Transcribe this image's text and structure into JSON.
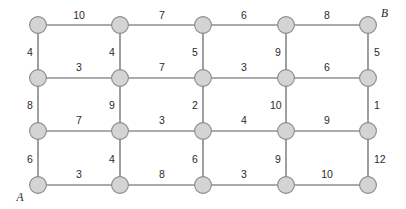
{
  "figure": {
    "background_color": "#ffffff",
    "node_fill_color": "#d4d4d4",
    "node_stroke_color": "#8a8a8a",
    "edge_color": "#58585a",
    "label_color": "#2b2b2b"
  },
  "terminals": [
    {
      "id": "A",
      "label": "A",
      "x": 20,
      "y": 201,
      "col": 0,
      "row": 3
    },
    {
      "id": "B",
      "label": "B",
      "x": 381,
      "y": 17,
      "col": 4,
      "row": 0
    }
  ],
  "geometry": {
    "columns_x": [
      38,
      120,
      203,
      286,
      368
    ],
    "rows_y": [
      25,
      78,
      131,
      185
    ],
    "node_radius": 8.4
  },
  "nodes": [
    {
      "id": "n00",
      "col": 0,
      "row": 0,
      "x": 38,
      "y": 25
    },
    {
      "id": "n10",
      "col": 1,
      "row": 0,
      "x": 120,
      "y": 25
    },
    {
      "id": "n20",
      "col": 2,
      "row": 0,
      "x": 203,
      "y": 25
    },
    {
      "id": "n30",
      "col": 3,
      "row": 0,
      "x": 286,
      "y": 25
    },
    {
      "id": "n40",
      "col": 4,
      "row": 0,
      "x": 368,
      "y": 25
    },
    {
      "id": "n01",
      "col": 0,
      "row": 1,
      "x": 38,
      "y": 78
    },
    {
      "id": "n11",
      "col": 1,
      "row": 1,
      "x": 120,
      "y": 78
    },
    {
      "id": "n21",
      "col": 2,
      "row": 1,
      "x": 203,
      "y": 78
    },
    {
      "id": "n31",
      "col": 3,
      "row": 1,
      "x": 286,
      "y": 78
    },
    {
      "id": "n41",
      "col": 4,
      "row": 1,
      "x": 368,
      "y": 78
    },
    {
      "id": "n02",
      "col": 0,
      "row": 2,
      "x": 38,
      "y": 131
    },
    {
      "id": "n12",
      "col": 1,
      "row": 2,
      "x": 120,
      "y": 131
    },
    {
      "id": "n22",
      "col": 2,
      "row": 2,
      "x": 203,
      "y": 131
    },
    {
      "id": "n32",
      "col": 3,
      "row": 2,
      "x": 286,
      "y": 131
    },
    {
      "id": "n42",
      "col": 4,
      "row": 2,
      "x": 368,
      "y": 131
    },
    {
      "id": "n03",
      "col": 0,
      "row": 3,
      "x": 38,
      "y": 185
    },
    {
      "id": "n13",
      "col": 1,
      "row": 3,
      "x": 120,
      "y": 185
    },
    {
      "id": "n23",
      "col": 2,
      "row": 3,
      "x": 203,
      "y": 185
    },
    {
      "id": "n33",
      "col": 3,
      "row": 3,
      "x": 286,
      "y": 185
    },
    {
      "id": "n43",
      "col": 4,
      "row": 3,
      "x": 368,
      "y": 185
    }
  ],
  "horizontal_edges": [
    {
      "from": "n00",
      "to": "n10",
      "row": 0,
      "weight": 10,
      "label": "10",
      "lx": 79,
      "ly": 19
    },
    {
      "from": "n10",
      "to": "n20",
      "row": 0,
      "weight": 7,
      "label": "7",
      "lx": 162,
      "ly": 19
    },
    {
      "from": "n20",
      "to": "n30",
      "row": 0,
      "weight": 6,
      "label": "6",
      "lx": 244,
      "ly": 19
    },
    {
      "from": "n30",
      "to": "n40",
      "row": 0,
      "weight": 8,
      "label": "8",
      "lx": 327,
      "ly": 19
    },
    {
      "from": "n01",
      "to": "n11",
      "row": 1,
      "weight": 3,
      "label": "3",
      "lx": 79,
      "ly": 71
    },
    {
      "from": "n11",
      "to": "n21",
      "row": 1,
      "weight": 7,
      "label": "7",
      "lx": 162,
      "ly": 71
    },
    {
      "from": "n21",
      "to": "n31",
      "row": 1,
      "weight": 3,
      "label": "3",
      "lx": 244,
      "ly": 71
    },
    {
      "from": "n31",
      "to": "n41",
      "row": 1,
      "weight": 6,
      "label": "6",
      "lx": 327,
      "ly": 71
    },
    {
      "from": "n02",
      "to": "n12",
      "row": 2,
      "weight": 7,
      "label": "7",
      "lx": 79,
      "ly": 124
    },
    {
      "from": "n12",
      "to": "n22",
      "row": 2,
      "weight": 3,
      "label": "3",
      "lx": 162,
      "ly": 124
    },
    {
      "from": "n22",
      "to": "n32",
      "row": 2,
      "weight": 4,
      "label": "4",
      "lx": 244,
      "ly": 124
    },
    {
      "from": "n32",
      "to": "n42",
      "row": 2,
      "weight": 9,
      "label": "9",
      "lx": 327,
      "ly": 124
    },
    {
      "from": "n03",
      "to": "n13",
      "row": 3,
      "weight": 3,
      "label": "3",
      "lx": 79,
      "ly": 178
    },
    {
      "from": "n13",
      "to": "n23",
      "row": 3,
      "weight": 8,
      "label": "8",
      "lx": 162,
      "ly": 178
    },
    {
      "from": "n23",
      "to": "n33",
      "row": 3,
      "weight": 3,
      "label": "3",
      "lx": 244,
      "ly": 178
    },
    {
      "from": "n33",
      "to": "n43",
      "row": 3,
      "weight": 10,
      "label": "10",
      "lx": 327,
      "ly": 178
    }
  ],
  "vertical_edges": [
    {
      "from": "n00",
      "to": "n01",
      "col": 0,
      "weight": 4,
      "label": "4",
      "lx": 27,
      "ly": 56
    },
    {
      "from": "n01",
      "to": "n02",
      "col": 0,
      "weight": 8,
      "label": "8",
      "lx": 27,
      "ly": 109
    },
    {
      "from": "n02",
      "to": "n03",
      "col": 0,
      "weight": 6,
      "label": "6",
      "lx": 27,
      "ly": 163
    },
    {
      "from": "n10",
      "to": "n11",
      "col": 1,
      "weight": 4,
      "label": "4",
      "lx": 109,
      "ly": 56
    },
    {
      "from": "n11",
      "to": "n12",
      "col": 1,
      "weight": 9,
      "label": "9",
      "lx": 109,
      "ly": 109
    },
    {
      "from": "n12",
      "to": "n13",
      "col": 1,
      "weight": 4,
      "label": "4",
      "lx": 109,
      "ly": 163
    },
    {
      "from": "n20",
      "to": "n21",
      "col": 2,
      "weight": 5,
      "label": "5",
      "lx": 192,
      "ly": 56
    },
    {
      "from": "n21",
      "to": "n22",
      "col": 2,
      "weight": 2,
      "label": "2",
      "lx": 192,
      "ly": 109
    },
    {
      "from": "n22",
      "to": "n23",
      "col": 2,
      "weight": 6,
      "label": "6",
      "lx": 192,
      "ly": 163
    },
    {
      "from": "n30",
      "to": "n31",
      "col": 3,
      "weight": 9,
      "label": "9",
      "lx": 275,
      "ly": 56
    },
    {
      "from": "n31",
      "to": "n32",
      "col": 3,
      "weight": 10,
      "label": "10",
      "lx": 270,
      "ly": 109
    },
    {
      "from": "n32",
      "to": "n33",
      "col": 3,
      "weight": 9,
      "label": "9",
      "lx": 275,
      "ly": 163
    },
    {
      "from": "n40",
      "to": "n41",
      "col": 4,
      "weight": 5,
      "label": "5",
      "lx": 374,
      "ly": 56
    },
    {
      "from": "n41",
      "to": "n42",
      "col": 4,
      "weight": 1,
      "label": "1",
      "lx": 374,
      "ly": 109
    },
    {
      "from": "n42",
      "to": "n43",
      "col": 4,
      "weight": 12,
      "label": "12",
      "lx": 374,
      "ly": 163
    }
  ]
}
